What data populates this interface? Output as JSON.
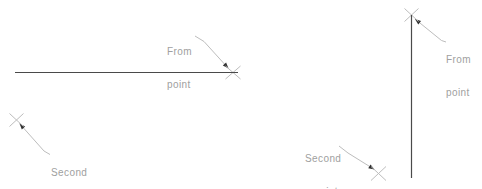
{
  "canvas": {
    "width": 482,
    "height": 189,
    "background": "#ffffff"
  },
  "colors": {
    "main_line": "#4a4a4a",
    "annotation_line": "#bdbdbd",
    "arrow": "#303030",
    "text": "#a0a0a0"
  },
  "labels": {
    "left_from": {
      "line1": "From",
      "line2": "point"
    },
    "left_second": {
      "line1": "Second",
      "line2": "point"
    },
    "right_from": {
      "line1": "From",
      "line2": "point"
    },
    "right_second": {
      "line1": "Second",
      "line2": "point"
    }
  },
  "figures": [
    {
      "name": "horizontal-line-demo",
      "main_line": {
        "x1": 15,
        "y1": 72.5,
        "x2": 238,
        "y2": 72.5
      },
      "crosses": [
        {
          "name": "from-point-marker",
          "cx": 233,
          "cy": 72.5,
          "rx": 7.5,
          "ry": 6.5
        },
        {
          "name": "second-point-marker",
          "cx": 16.5,
          "cy": 120,
          "rx": 7,
          "ry": 6.5
        }
      ],
      "leaders": [
        {
          "name": "from-point-leader",
          "points": [
            [
              195,
              36
            ],
            [
              204,
              41.5
            ],
            [
              228.5,
              68.5
            ]
          ],
          "arrow": "end"
        },
        {
          "name": "second-point-leader",
          "points": [
            [
              19.5,
              123.5
            ],
            [
              44,
              151
            ],
            [
              50,
              154.5
            ]
          ],
          "arrow": "start"
        }
      ]
    },
    {
      "name": "vertical-line-demo",
      "main_line": {
        "x1": 411.5,
        "y1": 15,
        "x2": 411.5,
        "y2": 178
      },
      "crosses": [
        {
          "name": "from-point-marker",
          "cx": 411.5,
          "cy": 15,
          "rx": 7,
          "ry": 6.5
        },
        {
          "name": "second-point-marker",
          "cx": 378.5,
          "cy": 173.5,
          "rx": 7.5,
          "ry": 7
        }
      ],
      "leaders": [
        {
          "name": "from-point-leader",
          "points": [
            [
              415,
              19
            ],
            [
              441.5,
              40.5
            ],
            [
              446,
              42
            ]
          ],
          "arrow": "start"
        },
        {
          "name": "second-point-leader",
          "points": [
            [
              339,
              146
            ],
            [
              348,
              153
            ],
            [
              374.5,
              169.5
            ]
          ],
          "arrow": "end"
        }
      ]
    }
  ]
}
